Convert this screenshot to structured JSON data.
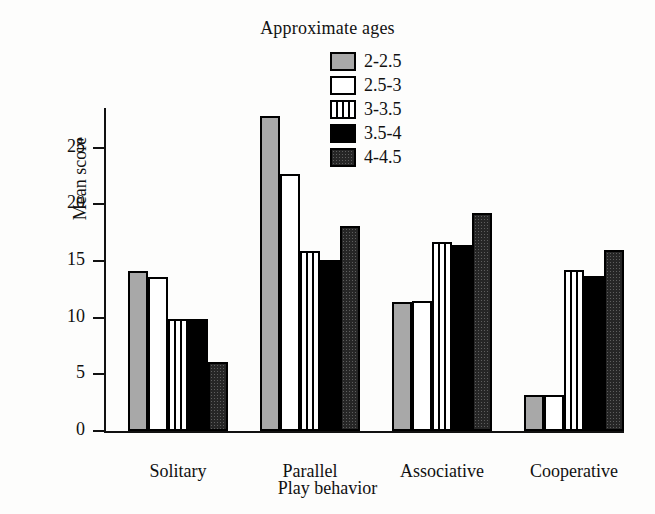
{
  "chart_data": {
    "type": "bar",
    "title": "",
    "legend_title": "Approximate ages",
    "legend_position": "top-center",
    "xlabel": "Play behavior",
    "ylabel": "Mean score",
    "categories": [
      "Solitary",
      "Parallel",
      "Associative",
      "Cooperative"
    ],
    "ylim": [
      0,
      28.5
    ],
    "yticks": [
      0,
      5,
      10,
      15,
      20,
      25
    ],
    "ytick_labels": [
      "0",
      "5",
      "10",
      "15",
      "20",
      "25"
    ],
    "grid": false,
    "series": [
      {
        "name": "2-2.5",
        "pattern": "solid-gray",
        "color": "#a8a8a8",
        "values": [
          14.1,
          27.8,
          11.4,
          3.2
        ]
      },
      {
        "name": "2.5-3",
        "pattern": "solid-white",
        "color": "#ffffff",
        "values": [
          13.6,
          22.7,
          11.5,
          3.2
        ]
      },
      {
        "name": "3-3.5",
        "pattern": "vertical-stripes",
        "color": "#ffffff",
        "values": [
          9.9,
          15.9,
          16.7,
          14.2
        ]
      },
      {
        "name": "3.5-4",
        "pattern": "solid-black",
        "color": "#000000",
        "values": [
          9.9,
          15.1,
          16.4,
          13.7
        ]
      },
      {
        "name": "4-4.5",
        "pattern": "dark-dotted",
        "color": "#262626",
        "values": [
          6.1,
          18.1,
          19.2,
          16.0
        ]
      }
    ]
  }
}
